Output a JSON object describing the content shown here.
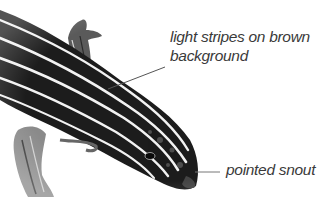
{
  "figure": {
    "annotations": [
      {
        "line1": "light stripes on brown",
        "line2": "background"
      },
      {
        "line1": "pointed snout"
      }
    ]
  },
  "colors": {
    "background": "#ffffff",
    "body_dark": "#1c1c1c",
    "stripe_light": "#f2f2f2",
    "leader_line": "#555555",
    "label_text": "#3a3a3a"
  }
}
